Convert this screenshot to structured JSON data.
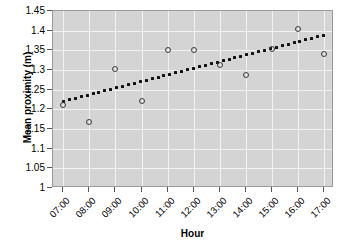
{
  "chart_data": {
    "type": "scatter",
    "title": "",
    "xlabel": "Hour",
    "ylabel": "Mean proximity (m)",
    "categories": [
      "07:00",
      "08:00",
      "09:00",
      "10:00",
      "11:00",
      "12:00",
      "13:00",
      "14:00",
      "15:00",
      "16:00",
      "17:00"
    ],
    "x": [
      7,
      8,
      9,
      10,
      11,
      12,
      13,
      14,
      15,
      16,
      17
    ],
    "values": [
      1.21,
      1.167,
      1.303,
      1.222,
      1.351,
      1.351,
      1.314,
      1.288,
      1.353,
      1.405,
      1.34
    ],
    "series": [
      {
        "name": "Mean proximity",
        "marker": "open-circle",
        "color": "#3b3b3b",
        "values": [
          1.21,
          1.167,
          1.303,
          1.222,
          1.351,
          1.351,
          1.314,
          1.288,
          1.353,
          1.405,
          1.34
        ]
      },
      {
        "name": "Trend line",
        "style": "dotted",
        "color": "#101010",
        "x_endpoints": [
          7,
          17
        ],
        "y_endpoints": [
          1.221,
          1.388
        ]
      }
    ],
    "ylim": [
      1.0,
      1.45
    ],
    "xlim": [
      6.6,
      17.4
    ],
    "yticks": [
      1,
      1.05,
      1.1,
      1.15,
      1.2,
      1.25,
      1.3,
      1.35,
      1.4,
      1.45
    ],
    "ytick_labels": [
      "1",
      "1.05",
      "1.1",
      "1.15",
      "1.2",
      "1.25",
      "1.3",
      "1.35",
      "1.4",
      "1.45"
    ],
    "xticks": [
      7,
      8,
      9,
      10,
      11,
      12,
      13,
      14,
      15,
      16,
      17
    ],
    "xtick_labels": [
      "07:00",
      "08:00",
      "09:00",
      "10:00",
      "11:00",
      "12:00",
      "13:00",
      "14:00",
      "15:00",
      "16:00",
      "17:00"
    ],
    "xtick_rotation": -45,
    "grid": true,
    "grid_color": "#f2f2f2",
    "plot_background": "#d4d4d4",
    "figure_background": "#ffffff",
    "legend": null
  }
}
